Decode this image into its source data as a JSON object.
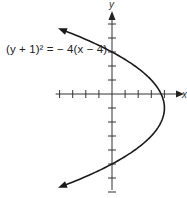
{
  "chart_data": {
    "type": "line",
    "title": "",
    "equation": "(y + 1)² = − 4(x − 4)",
    "xlabel": "x",
    "ylabel": "y",
    "xlim": [
      -4,
      4
    ],
    "ylim": [
      -7,
      5
    ],
    "grid": false,
    "x_ticks": [
      -4,
      -3,
      -2,
      -1,
      1,
      2,
      3,
      4
    ],
    "y_ticks": [
      -7,
      -6,
      -5,
      -4,
      -3,
      -2,
      -1,
      1,
      2,
      3,
      4,
      5
    ],
    "series": [
      {
        "name": "(y + 1)² = − 4(x − 4)",
        "curve": "parabola opening left",
        "vertex": [
          4,
          -1
        ],
        "points": [
          {
            "x": -4.2,
            "y": 4.73
          },
          {
            "x": 0,
            "y": 3
          },
          {
            "x": 3,
            "y": 1
          },
          {
            "x": 4,
            "y": -1
          },
          {
            "x": 3,
            "y": -3
          },
          {
            "x": 0,
            "y": -5
          },
          {
            "x": -4.2,
            "y": -6.73
          }
        ],
        "arrows": "both ends"
      }
    ],
    "annotations": [
      "(y + 1)² = − 4(x − 4)"
    ]
  },
  "labels": {
    "equation": "(y + 1)² = − 4(x − 4)",
    "x_axis": "x",
    "y_axis": "y"
  },
  "colors": {
    "axis": "#333333",
    "curve": "#1a1a1a",
    "background": "#ffffff"
  }
}
